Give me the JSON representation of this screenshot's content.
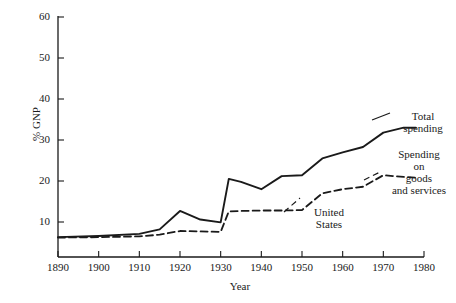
{
  "chart_data": {
    "type": "line",
    "title": "",
    "xlabel": "Year",
    "ylabel": "% GNP",
    "xlim": [
      1890,
      1980
    ],
    "ylim": [
      0,
      60
    ],
    "xticks": [
      1890,
      1900,
      1910,
      1920,
      1930,
      1940,
      1950,
      1960,
      1970,
      1980
    ],
    "yticks": [
      10,
      20,
      30,
      40,
      50,
      60
    ],
    "grid": false,
    "legend_position": "inline-annotations",
    "annotations": [
      {
        "text": "Total spending",
        "kind": "series-label"
      },
      {
        "text": "Spending on goods and services",
        "kind": "series-label"
      },
      {
        "text": "United States",
        "kind": "region-label"
      }
    ],
    "x": [
      1890,
      1900,
      1910,
      1915,
      1920,
      1925,
      1930,
      1932,
      1935,
      1940,
      1945,
      1950,
      1955,
      1960,
      1965,
      1970,
      1975,
      1978
    ],
    "series": [
      {
        "name": "Total spending",
        "style": "solid",
        "values": [
          6.3,
          6.6,
          7.1,
          8.2,
          12.7,
          10.6,
          9.9,
          20.5,
          19.8,
          18.0,
          21.2,
          21.4,
          25.5,
          27.0,
          28.3,
          31.8,
          33.0,
          33.0
        ]
      },
      {
        "name": "Spending on goods and services",
        "style": "dashed",
        "values": [
          6.2,
          6.3,
          6.5,
          6.9,
          7.8,
          7.7,
          7.6,
          12.6,
          12.7,
          12.8,
          12.8,
          12.9,
          17.0,
          18.0,
          18.6,
          21.4,
          21.0,
          20.8
        ]
      }
    ],
    "tick_labels": {
      "x": [
        "1890",
        "1900",
        "1910",
        "1920",
        "1930",
        "1940",
        "1950",
        "1960",
        "1970",
        "1980"
      ],
      "y": [
        "10",
        "20",
        "30",
        "40",
        "50",
        "60"
      ]
    },
    "series_labels": {
      "total": [
        "Total",
        "spending"
      ],
      "goods": [
        "Spending",
        "on",
        "goods",
        "and services"
      ],
      "country": [
        "United",
        "States"
      ]
    },
    "colors": {
      "line": "#1a1a1a",
      "axis": "#1a1a1a",
      "background": "#ffffff"
    }
  }
}
